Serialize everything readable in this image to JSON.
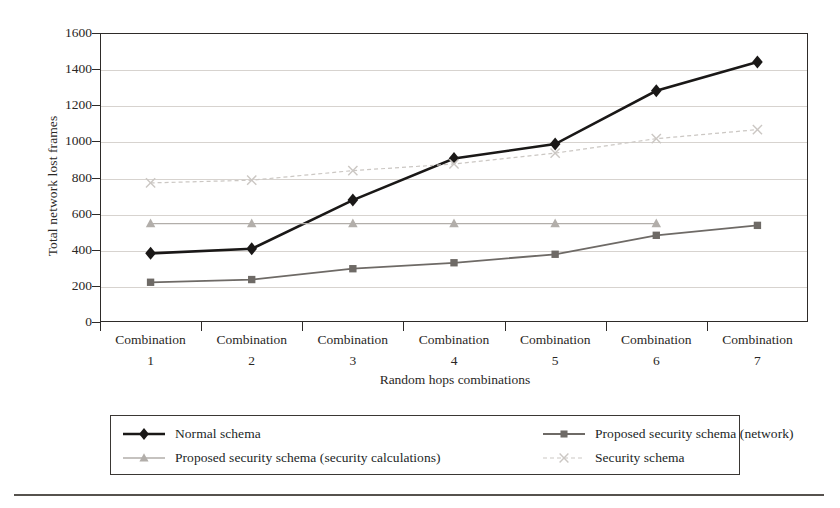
{
  "chart_data": {
    "type": "line",
    "title": "",
    "xlabel": "Random hops combinations",
    "ylabel": "Total network lost frames",
    "categories": [
      "Combination 1",
      "Combination 2",
      "Combination 3",
      "Combination 4",
      "Combination 5",
      "Combination 6",
      "Combination 7"
    ],
    "category_lines": [
      [
        "Combination",
        "1"
      ],
      [
        "Combination",
        "2"
      ],
      [
        "Combination",
        "3"
      ],
      [
        "Combination",
        "4"
      ],
      [
        "Combination",
        "5"
      ],
      [
        "Combination",
        "6"
      ],
      [
        "Combination",
        "7"
      ]
    ],
    "ylim": [
      0,
      1600
    ],
    "yticks": [
      0,
      200,
      400,
      600,
      800,
      1000,
      1200,
      1400,
      1600
    ],
    "grid": true,
    "legend_position": "bottom",
    "series": [
      {
        "name": "Normal schema",
        "marker": "diamond",
        "color": "#1a1817",
        "line_width": 2.6,
        "dash": "none",
        "values": [
          380,
          405,
          675,
          905,
          985,
          1280,
          1440
        ]
      },
      {
        "name": "Proposed security schema (network)",
        "marker": "square",
        "color": "#6e6a66",
        "line_width": 1.8,
        "dash": "none",
        "values": [
          220,
          235,
          295,
          328,
          375,
          480,
          535
        ]
      },
      {
        "name": "Proposed security schema (security calculations)",
        "marker": "triangle",
        "color": "#b2aeaa",
        "line_width": 1.4,
        "dash": "none",
        "values": [
          545,
          545,
          545,
          545,
          545,
          545,
          null
        ]
      },
      {
        "name": "Security schema",
        "marker": "cross",
        "color": "#cbc7c3",
        "line_width": 1.2,
        "dash": "4 3",
        "values": [
          770,
          785,
          838,
          875,
          935,
          1015,
          1065
        ]
      }
    ]
  },
  "legend": {
    "entries": [
      "Normal schema",
      "Proposed security schema (network)",
      "Proposed security schema (security calculations)",
      "Security schema"
    ]
  }
}
